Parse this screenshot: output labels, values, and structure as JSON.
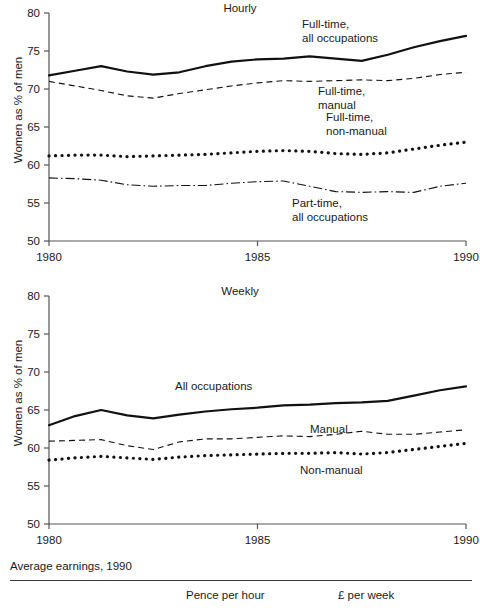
{
  "figure": {
    "ylabel": "Women as % of men",
    "footer": {
      "title": "Average earnings, 1990",
      "columns": [
        "Pence per hour",
        "£ per week"
      ]
    }
  },
  "chart_data": [
    {
      "type": "line",
      "title": "Hourly",
      "xlabel": "",
      "ylabel": "Women as % of men",
      "xlim": [
        1980,
        1990
      ],
      "ylim": [
        50,
        80
      ],
      "yticks": [
        50,
        55,
        60,
        65,
        70,
        75,
        80
      ],
      "xticks": [
        1980,
        1985,
        1990
      ],
      "xticklabels": [
        "1980",
        "1985",
        "1990"
      ],
      "grid": false,
      "legend_position": "inline-annotations",
      "x": [
        1980,
        1980.625,
        1981.25,
        1981.875,
        1982.5,
        1983.125,
        1983.75,
        1984.375,
        1985,
        1985.625,
        1986.25,
        1986.875,
        1987.5,
        1988.125,
        1988.75,
        1989.375,
        1990
      ],
      "series": [
        {
          "name": "Full-time, all occupations",
          "style": "solid",
          "label_lines": [
            "Full-time,",
            "all occupations"
          ],
          "values": [
            71.8,
            72.4,
            73.0,
            72.3,
            71.9,
            72.2,
            73.0,
            73.6,
            73.9,
            74.0,
            74.3,
            74.0,
            73.7,
            74.5,
            75.5,
            76.3,
            77.0
          ]
        },
        {
          "name": "Full-time, manual",
          "style": "dashed",
          "label_lines": [
            "Full-time,",
            "manual"
          ],
          "values": [
            71.0,
            70.4,
            69.8,
            69.1,
            68.8,
            69.4,
            69.9,
            70.4,
            70.8,
            71.1,
            71.0,
            71.1,
            71.2,
            71.1,
            71.4,
            71.9,
            72.2
          ]
        },
        {
          "name": "Full-time, non-manual",
          "style": "dotted",
          "label_lines": [
            "Full-time,",
            "non-manual"
          ],
          "values": [
            61.2,
            61.3,
            61.3,
            61.1,
            61.2,
            61.3,
            61.4,
            61.6,
            61.8,
            61.9,
            61.8,
            61.5,
            61.4,
            61.6,
            62.1,
            62.6,
            63.0
          ]
        },
        {
          "name": "Part-time, all occupations",
          "style": "dashdot",
          "label_lines": [
            "Part-time,",
            "all occupations"
          ],
          "values": [
            58.3,
            58.2,
            58.0,
            57.4,
            57.2,
            57.3,
            57.3,
            57.6,
            57.8,
            57.9,
            57.2,
            56.5,
            56.4,
            56.5,
            56.4,
            57.2,
            57.6
          ]
        }
      ]
    },
    {
      "type": "line",
      "title": "Weekly",
      "xlabel": "",
      "ylabel": "Women as % of men",
      "xlim": [
        1980,
        1990
      ],
      "ylim": [
        50,
        80
      ],
      "yticks": [
        50,
        55,
        60,
        65,
        70,
        75,
        80
      ],
      "xticks": [
        1980,
        1985,
        1990
      ],
      "xticklabels": [
        "1980",
        "1985",
        "1990"
      ],
      "grid": false,
      "legend_position": "inline-annotations",
      "x": [
        1980,
        1980.625,
        1981.25,
        1981.875,
        1982.5,
        1983.125,
        1983.75,
        1984.375,
        1985,
        1985.625,
        1986.25,
        1986.875,
        1987.5,
        1988.125,
        1988.75,
        1989.375,
        1990
      ],
      "series": [
        {
          "name": "All occupations",
          "style": "solid",
          "label_lines": [
            "All occupations"
          ],
          "values": [
            63.0,
            64.2,
            65.0,
            64.3,
            63.9,
            64.4,
            64.8,
            65.1,
            65.3,
            65.6,
            65.7,
            65.9,
            66.0,
            66.2,
            66.9,
            67.6,
            68.1
          ]
        },
        {
          "name": "Manual",
          "style": "dashed",
          "label_lines": [
            "Manual"
          ],
          "values": [
            60.9,
            61.0,
            61.1,
            60.3,
            59.8,
            60.8,
            61.2,
            61.2,
            61.4,
            61.6,
            61.5,
            61.8,
            62.2,
            61.8,
            61.8,
            62.1,
            62.4
          ]
        },
        {
          "name": "Non-manual",
          "style": "dotted",
          "label_lines": [
            "Non-manual"
          ],
          "values": [
            58.4,
            58.7,
            58.9,
            58.7,
            58.5,
            58.8,
            59.0,
            59.1,
            59.2,
            59.3,
            59.3,
            59.4,
            59.2,
            59.4,
            59.8,
            60.2,
            60.6
          ]
        }
      ]
    }
  ]
}
